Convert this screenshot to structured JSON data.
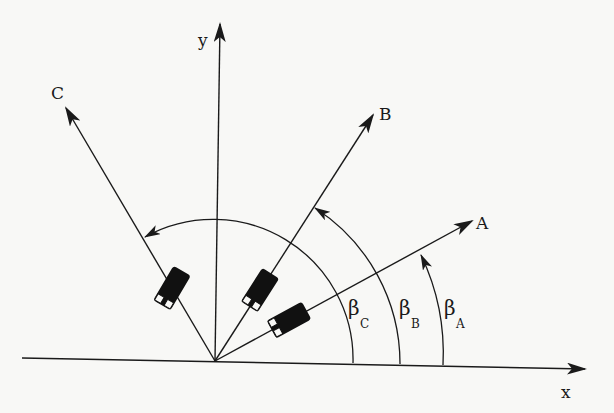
{
  "diagram": {
    "axes": {
      "x_label": "x",
      "y_label": "y"
    },
    "vectors": [
      {
        "id": "A",
        "label": "A"
      },
      {
        "id": "B",
        "label": "B"
      },
      {
        "id": "C",
        "label": "C"
      }
    ],
    "angles": [
      {
        "id": "beta_C",
        "symbol": "β",
        "subscript": "C"
      },
      {
        "id": "beta_B",
        "symbol": "β",
        "subscript": "B"
      },
      {
        "id": "beta_A",
        "symbol": "β",
        "subscript": "A"
      }
    ],
    "vehicles": [
      {
        "id": "vehicle-A",
        "on_vector": "A"
      },
      {
        "id": "vehicle-B",
        "on_vector": "B"
      },
      {
        "id": "vehicle-C",
        "on_vector": "C"
      }
    ],
    "colors": {
      "ink": "#1a1a1a",
      "background": "#f8f8f6"
    }
  }
}
